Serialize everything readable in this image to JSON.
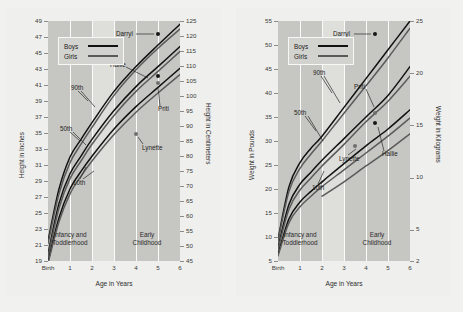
{
  "figure": {
    "background": "#f1f1ef",
    "panel_background": "#efefed",
    "plot_background": "#dededa",
    "band_background": "#c6c6c2",
    "boys_color": "#111111",
    "girls_color": "#5a5a5a"
  },
  "charts": [
    {
      "id": "height-chart",
      "type": "line",
      "title": "",
      "xlabel": "Age in Years",
      "ylabel_left": "Height in Inches",
      "ylabel_right": "Height in Centimeters",
      "x_ticks": [
        "Birth",
        "1",
        "2",
        "3",
        "4",
        "5",
        "6"
      ],
      "x_values": [
        0,
        1,
        2,
        3,
        4,
        5,
        6
      ],
      "xlim": [
        0,
        6
      ],
      "ylim_left": [
        19,
        49
      ],
      "y_ticks_left": [
        19,
        21,
        23,
        25,
        27,
        29,
        31,
        33,
        35,
        37,
        39,
        41,
        43,
        45,
        47,
        49
      ],
      "ylim_right": [
        45,
        125
      ],
      "y_ticks_right": [
        45,
        50,
        55,
        60,
        65,
        70,
        75,
        80,
        85,
        90,
        95,
        100,
        105,
        110,
        115,
        120,
        125
      ],
      "legend": [
        {
          "label": "Boys",
          "color": "#111111"
        },
        {
          "label": "Girls",
          "color": "#5a5a5a"
        }
      ],
      "bands": [
        {
          "label": "Infancy and\nToddlerhood",
          "line1": "Infancy and",
          "line2": "Toddlerhood",
          "from": 0,
          "to": 2
        },
        {
          "label": "Early\nChildhood",
          "line1": "Early",
          "line2": "Childhood",
          "from": 3,
          "to": 6
        }
      ],
      "percentile_labels": [
        "90th",
        "50th",
        "10th"
      ],
      "series": [
        {
          "name": "Boys 90th",
          "sex": "Boys",
          "percentile": 90,
          "color": "#111111",
          "x": [
            0,
            0.5,
            1,
            1.5,
            2,
            3,
            4,
            5,
            6
          ],
          "y": [
            21.5,
            28.0,
            32.0,
            34.2,
            36.3,
            40.2,
            43.3,
            46.0,
            48.6
          ]
        },
        {
          "name": "Girls 90th",
          "sex": "Girls",
          "percentile": 90,
          "color": "#5a5a5a",
          "x": [
            0,
            0.5,
            1,
            1.5,
            2,
            3,
            4,
            5,
            6
          ],
          "y": [
            21.2,
            27.4,
            31.3,
            33.6,
            35.7,
            39.7,
            42.9,
            45.6,
            48.0
          ]
        },
        {
          "name": "Boys 50th",
          "sex": "Boys",
          "percentile": 50,
          "color": "#111111",
          "x": [
            0,
            0.5,
            1,
            1.5,
            2,
            3,
            4,
            5,
            6
          ],
          "y": [
            19.9,
            26.2,
            29.9,
            32.1,
            34.2,
            37.8,
            40.8,
            43.3,
            45.8
          ]
        },
        {
          "name": "Girls 50th",
          "sex": "Girls",
          "percentile": 50,
          "color": "#5a5a5a",
          "x": [
            0,
            0.5,
            1,
            1.5,
            2,
            3,
            4,
            5,
            6
          ],
          "y": [
            19.6,
            25.6,
            29.3,
            31.5,
            33.6,
            37.2,
            40.2,
            42.7,
            45.2
          ]
        },
        {
          "name": "Boys 10th",
          "sex": "Boys",
          "percentile": 10,
          "color": "#111111",
          "x": [
            0,
            0.5,
            1,
            1.5,
            2,
            3,
            4,
            5,
            6
          ],
          "y": [
            18.9,
            24.4,
            28.0,
            30.2,
            32.1,
            35.5,
            38.3,
            40.7,
            43.1
          ]
        },
        {
          "name": "Girls 10th",
          "sex": "Girls",
          "percentile": 10,
          "color": "#5a5a5a",
          "x": [
            0,
            0.5,
            1,
            1.5,
            2,
            3,
            4,
            5,
            6
          ],
          "y": [
            18.7,
            23.9,
            27.4,
            29.6,
            31.5,
            34.8,
            37.6,
            40.0,
            42.3
          ]
        }
      ],
      "points": [
        {
          "name": "Darryl",
          "x": 5.0,
          "y": 48.6,
          "color": "#171717",
          "label_side": "left"
        },
        {
          "name": "Hallie",
          "x": 5.0,
          "y": 43.3,
          "color": "#171717",
          "label_side": "left"
        },
        {
          "name": "Priti",
          "x": 5.0,
          "y": 42.4,
          "color": "#6f6f6f",
          "label_side": "right"
        },
        {
          "name": "Lynette",
          "x": 4.0,
          "y": 36.2,
          "color": "#6f6f6f",
          "label_side": "right"
        }
      ]
    },
    {
      "id": "weight-chart",
      "type": "line",
      "title": "",
      "xlabel": "Age in Years",
      "ylabel_left": "Weight in Pounds",
      "ylabel_right": "Weight in Kilograms",
      "x_ticks": [
        "Birth",
        "1",
        "2",
        "3",
        "4",
        "5",
        "6"
      ],
      "x_values": [
        0,
        1,
        2,
        3,
        4,
        5,
        6
      ],
      "xlim": [
        0,
        6
      ],
      "ylim_left": [
        5,
        55
      ],
      "y_ticks_left": [
        5,
        10,
        15,
        20,
        25,
        30,
        35,
        40,
        45,
        50,
        55
      ],
      "ylim_right": [
        2,
        25
      ],
      "y_ticks_right": [
        2,
        5,
        10,
        15,
        20,
        25
      ],
      "legend": [
        {
          "label": "Boys",
          "color": "#111111"
        },
        {
          "label": "Girls",
          "color": "#5a5a5a"
        }
      ],
      "bands": [
        {
          "label": "Infancy and\nToddlerhood",
          "line1": "Infancy and",
          "line2": "Toddlerhood",
          "from": 0,
          "to": 2
        },
        {
          "label": "Early\nChildhood",
          "line1": "Early",
          "line2": "Childhood",
          "from": 3,
          "to": 6
        }
      ],
      "percentile_labels": [
        "90th",
        "50th",
        "10th"
      ],
      "series": [
        {
          "name": "Boys 90th",
          "sex": "Boys",
          "percentile": 90,
          "color": "#111111",
          "x": [
            0,
            0.5,
            1,
            1.5,
            2,
            3,
            4,
            5,
            6
          ],
          "y": [
            9.5,
            20.5,
            25.5,
            28.5,
            31.0,
            37.0,
            43.0,
            49.0,
            55.0
          ]
        },
        {
          "name": "Girls 90th",
          "sex": "Girls",
          "percentile": 90,
          "color": "#5a5a5a",
          "x": [
            0,
            0.5,
            1,
            1.5,
            2,
            3,
            4,
            5,
            6
          ],
          "y": [
            9.2,
            19.5,
            24.3,
            27.3,
            30.0,
            35.8,
            41.5,
            47.3,
            53.5
          ]
        },
        {
          "name": "Boys 50th",
          "sex": "Boys",
          "percentile": 50,
          "color": "#111111",
          "x": [
            0,
            0.5,
            1,
            1.5,
            2,
            3,
            4,
            5,
            6
          ],
          "y": [
            7.8,
            16.8,
            21.0,
            23.5,
            26.0,
            30.5,
            35.0,
            39.5,
            45.5
          ]
        },
        {
          "name": "Girls 50th",
          "sex": "Girls",
          "percentile": 50,
          "color": "#5a5a5a",
          "x": [
            0,
            0.5,
            1,
            1.5,
            2,
            3,
            4,
            5,
            6
          ],
          "y": [
            7.5,
            15.8,
            19.8,
            22.3,
            24.8,
            29.3,
            34.0,
            38.3,
            43.5
          ]
        },
        {
          "name": "Boys 10th",
          "sex": "Boys",
          "percentile": 10,
          "color": "#111111",
          "x": [
            0,
            0.5,
            1,
            1.5,
            2,
            3,
            4,
            5,
            6
          ],
          "y": [
            6.4,
            13.8,
            17.3,
            19.5,
            21.5,
            25.3,
            29.0,
            32.5,
            36.5
          ]
        },
        {
          "name": "Girls 10th",
          "sex": "Girls",
          "percentile": 10,
          "color": "#5a5a5a",
          "x": [
            0,
            0.5,
            1,
            1.5,
            2,
            3,
            4,
            5,
            6
          ],
          "y": [
            6.1,
            13.0,
            16.3,
            18.5,
            20.5,
            24.0,
            27.5,
            31.0,
            34.8
          ]
        },
        {
          "name": "Girls 3rd",
          "sex": "Girls",
          "percentile": 3,
          "color": "#5a5a5a",
          "x": [
            2,
            3,
            4,
            5,
            6
          ],
          "y": [
            18.5,
            21.5,
            24.8,
            28.0,
            31.5
          ]
        }
      ],
      "points": [
        {
          "name": "Darryl",
          "x": 4.4,
          "y": 54.0,
          "color": "#171717",
          "label_side": "left"
        },
        {
          "name": "Priti",
          "x": 4.4,
          "y": 37.0,
          "color": "#6f6f6f",
          "label_side": "left"
        },
        {
          "name": "Hallie",
          "x": 4.4,
          "y": 34.8,
          "color": "#171717",
          "label_side": "right"
        },
        {
          "name": "Lynette",
          "x": 3.5,
          "y": 30.0,
          "color": "#6f6f6f",
          "label_side": "right"
        }
      ]
    }
  ]
}
